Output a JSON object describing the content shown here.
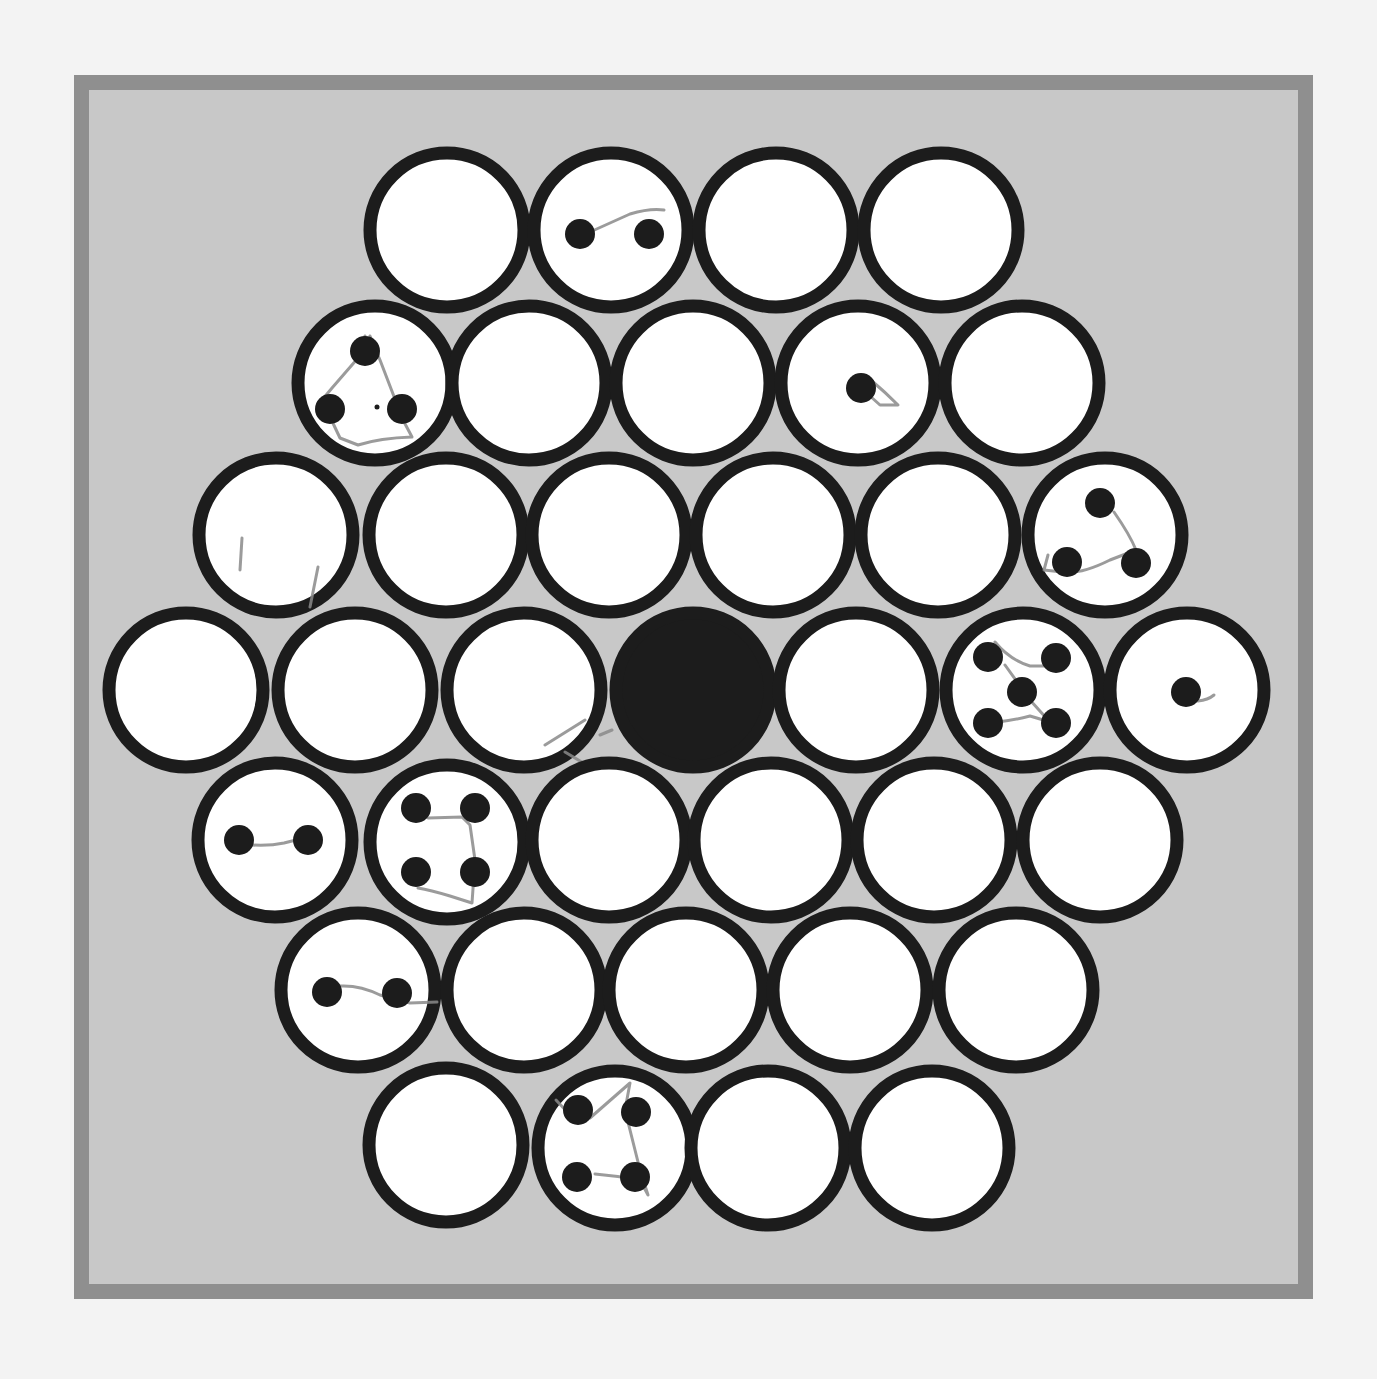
{
  "colors": {
    "page_background": "#f3f3f3",
    "frame_border": "#8f8f8f",
    "board_field": "#c8c8c8",
    "cell_fill": "#ffffff",
    "cell_ring": "#1c1c1c",
    "center_cell_fill": "#1c1c1c",
    "pip": "#1c1c1c",
    "pencil_trace": "#8a8a8a"
  },
  "board": {
    "shape": "hexagon",
    "row_sizes": [
      4,
      5,
      6,
      7,
      6,
      5,
      4
    ],
    "cell_radius": 77,
    "pip_radius": 15,
    "cells": [
      {
        "id": "r1c1",
        "row": 1,
        "col": 1,
        "cx": 447,
        "cy": 230,
        "state": "empty",
        "pips": []
      },
      {
        "id": "r1c2",
        "row": 1,
        "col": 2,
        "cx": 611,
        "cy": 230,
        "state": "pips",
        "pips": [
          [
            580,
            234
          ],
          [
            649,
            234
          ]
        ],
        "trace": "M590,232 L630,214 Q650,208 664,210"
      },
      {
        "id": "r1c3",
        "row": 1,
        "col": 3,
        "cx": 776,
        "cy": 230,
        "state": "empty",
        "pips": []
      },
      {
        "id": "r1c4",
        "row": 1,
        "col": 4,
        "cx": 941,
        "cy": 230,
        "state": "empty",
        "pips": []
      },
      {
        "id": "r2c1",
        "row": 2,
        "col": 1,
        "cx": 375,
        "cy": 383,
        "state": "pips",
        "pips": [
          [
            365,
            351
          ],
          [
            330,
            409
          ],
          [
            402,
            409
          ]
        ],
        "speck": [
          377,
          407
        ],
        "trace": "M365,336 L358,358 L332,388 L322,400 L340,438 L358,445 Q380,438 412,437 L403,420 L380,360 L370,336"
      },
      {
        "id": "r2c2",
        "row": 2,
        "col": 2,
        "cx": 529,
        "cy": 383,
        "state": "empty",
        "pips": []
      },
      {
        "id": "r2c3",
        "row": 2,
        "col": 3,
        "cx": 693,
        "cy": 383,
        "state": "empty",
        "pips": []
      },
      {
        "id": "r2c4",
        "row": 2,
        "col": 4,
        "cx": 858,
        "cy": 383,
        "state": "pips",
        "pips": [
          [
            861,
            388
          ]
        ],
        "trace": "M872,381 Q885,392 898,405 L880,405 L870,396"
      },
      {
        "id": "r2c5",
        "row": 2,
        "col": 5,
        "cx": 1022,
        "cy": 383,
        "state": "empty",
        "pips": []
      },
      {
        "id": "r3c1",
        "row": 3,
        "col": 1,
        "cx": 276,
        "cy": 535,
        "state": "empty",
        "pips": [],
        "trace": "M242,538 L240,570 M318,567 L310,607"
      },
      {
        "id": "r3c2",
        "row": 3,
        "col": 2,
        "cx": 446,
        "cy": 535,
        "state": "empty",
        "pips": []
      },
      {
        "id": "r3c3",
        "row": 3,
        "col": 3,
        "cx": 609,
        "cy": 535,
        "state": "empty",
        "pips": []
      },
      {
        "id": "r3c4",
        "row": 3,
        "col": 4,
        "cx": 773,
        "cy": 535,
        "state": "empty",
        "pips": []
      },
      {
        "id": "r3c5",
        "row": 3,
        "col": 5,
        "cx": 938,
        "cy": 535,
        "state": "empty",
        "pips": []
      },
      {
        "id": "r3c6",
        "row": 3,
        "col": 6,
        "cx": 1105,
        "cy": 535,
        "state": "pips",
        "pips": [
          [
            1100,
            503
          ],
          [
            1067,
            562
          ],
          [
            1136,
            563
          ]
        ],
        "trace": "M1114,512 Q1130,535 1136,550 L1110,560 Q1080,575 1062,572 L1044,570 L1048,555"
      },
      {
        "id": "r4c1",
        "row": 4,
        "col": 1,
        "cx": 186,
        "cy": 690,
        "state": "empty",
        "pips": []
      },
      {
        "id": "r4c2",
        "row": 4,
        "col": 2,
        "cx": 355,
        "cy": 690,
        "state": "empty",
        "pips": []
      },
      {
        "id": "r4c3",
        "row": 4,
        "col": 3,
        "cx": 524,
        "cy": 690,
        "state": "empty",
        "pips": [],
        "trace": "M545,745 L585,720 M565,752 L595,770 L582,775 M600,735 L612,730"
      },
      {
        "id": "r4c4",
        "row": 4,
        "col": 4,
        "cx": 693,
        "cy": 690,
        "state": "filled-center",
        "pips": []
      },
      {
        "id": "r4c5",
        "row": 4,
        "col": 5,
        "cx": 856,
        "cy": 690,
        "state": "empty",
        "pips": []
      },
      {
        "id": "r4c6",
        "row": 4,
        "col": 6,
        "cx": 1023,
        "cy": 690,
        "state": "pips",
        "pips": [
          [
            988,
            657
          ],
          [
            1056,
            658
          ],
          [
            1022,
            692
          ],
          [
            988,
            723
          ],
          [
            1056,
            723
          ]
        ],
        "trace": "M995,642 Q1010,660 1030,666 L1048,666 M1005,665 L1030,700 L1048,720 M998,722 Q1015,720 1030,716 L1050,722"
      },
      {
        "id": "r4c7",
        "row": 4,
        "col": 7,
        "cx": 1187,
        "cy": 690,
        "state": "pips",
        "pips": [
          [
            1186,
            692
          ]
        ],
        "trace": "M1198,701 Q1208,700 1214,695"
      },
      {
        "id": "r5c1",
        "row": 5,
        "col": 1,
        "cx": 275,
        "cy": 840,
        "state": "pips",
        "pips": [
          [
            239,
            840
          ],
          [
            308,
            840
          ]
        ],
        "trace": "M252,845 Q270,846 284,843 L296,840"
      },
      {
        "id": "r5c2",
        "row": 5,
        "col": 2,
        "cx": 447,
        "cy": 842,
        "state": "pips",
        "pips": [
          [
            416,
            808
          ],
          [
            475,
            808
          ],
          [
            416,
            872
          ],
          [
            475,
            872
          ]
        ],
        "trace": "M428,818 L462,817 L470,825 L475,860 L472,903 L450,896 Q430,890 418,888"
      },
      {
        "id": "r5c3",
        "row": 5,
        "col": 3,
        "cx": 609,
        "cy": 840,
        "state": "empty",
        "pips": []
      },
      {
        "id": "r5c4",
        "row": 5,
        "col": 4,
        "cx": 771,
        "cy": 840,
        "state": "empty",
        "pips": []
      },
      {
        "id": "r5c5",
        "row": 5,
        "col": 5,
        "cx": 934,
        "cy": 840,
        "state": "empty",
        "pips": []
      },
      {
        "id": "r5c6",
        "row": 5,
        "col": 6,
        "cx": 1100,
        "cy": 840,
        "state": "empty",
        "pips": []
      },
      {
        "id": "r6c1",
        "row": 6,
        "col": 1,
        "cx": 358,
        "cy": 990,
        "state": "pips",
        "pips": [
          [
            327,
            992
          ],
          [
            397,
            993
          ]
        ],
        "trace": "M340,986 Q360,985 380,995 L410,1003 L437,1002"
      },
      {
        "id": "r6c2",
        "row": 6,
        "col": 2,
        "cx": 524,
        "cy": 990,
        "state": "empty",
        "pips": []
      },
      {
        "id": "r6c3",
        "row": 6,
        "col": 3,
        "cx": 686,
        "cy": 990,
        "state": "empty",
        "pips": []
      },
      {
        "id": "r6c4",
        "row": 6,
        "col": 4,
        "cx": 850,
        "cy": 990,
        "state": "empty",
        "pips": []
      },
      {
        "id": "r6c5",
        "row": 6,
        "col": 5,
        "cx": 1016,
        "cy": 990,
        "state": "empty",
        "pips": []
      },
      {
        "id": "r7c1",
        "row": 7,
        "col": 1,
        "cx": 446,
        "cy": 1145,
        "state": "empty",
        "pips": []
      },
      {
        "id": "r7c2",
        "row": 7,
        "col": 2,
        "cx": 615,
        "cy": 1148,
        "state": "pips",
        "pips": [
          [
            578,
            1110
          ],
          [
            636,
            1112
          ],
          [
            577,
            1177
          ],
          [
            635,
            1177
          ]
        ],
        "trace": "M556,1100 L570,1115 L590,1118 L630,1083 L625,1110 L640,1170 L648,1195 L640,1180 Q618,1176 595,1174"
      },
      {
        "id": "r7c3",
        "row": 7,
        "col": 3,
        "cx": 768,
        "cy": 1148,
        "state": "empty",
        "pips": []
      },
      {
        "id": "r7c4",
        "row": 7,
        "col": 4,
        "cx": 932,
        "cy": 1148,
        "state": "empty",
        "pips": []
      }
    ]
  },
  "summary": {
    "total_cells": 37,
    "filled_center_cells": 1,
    "cells_with_pips": 11,
    "pip_counts": [
      2,
      3,
      1,
      3,
      5,
      1,
      2,
      4,
      2,
      4
    ]
  }
}
